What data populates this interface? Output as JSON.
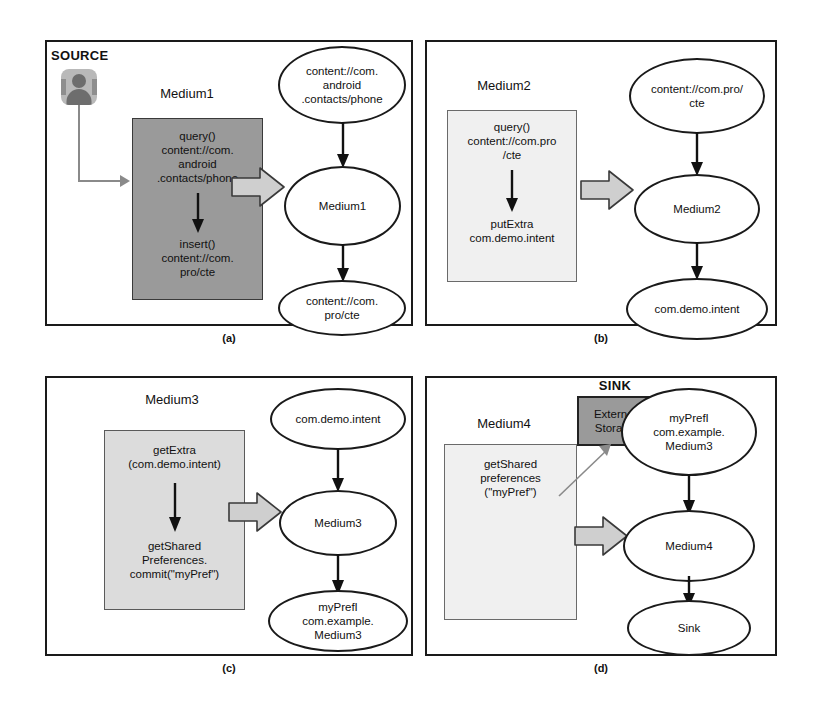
{
  "figure": {
    "panels": [
      {
        "id": "a",
        "caption": "(a)",
        "source_label": "SOURCE",
        "source_icon": "contacts-person-icon",
        "component_label": "Medium1",
        "code_box": {
          "shade": "dark",
          "top_text": "query()\ncontent://com.\nandroid\n.contacts/phone",
          "bottom_text": "insert()\ncontent://com.\npro/cte"
        },
        "graph_nodes": [
          {
            "label": "content://com.\nandroid\n.contacts/phone"
          },
          {
            "label": "Medium1"
          },
          {
            "label": "content://com.\npro/cte"
          }
        ]
      },
      {
        "id": "b",
        "caption": "(b)",
        "component_label": "Medium2",
        "code_box": {
          "shade": "pale",
          "top_text": "query()\ncontent://com.pro\n/cte",
          "bottom_text": "putExtra\ncom.demo.intent"
        },
        "graph_nodes": [
          {
            "label": "content://com.pro/\ncte"
          },
          {
            "label": "Medium2"
          },
          {
            "label": "com.demo.intent"
          }
        ]
      },
      {
        "id": "c",
        "caption": "(c)",
        "component_label": "Medium3",
        "code_box": {
          "shade": "mid",
          "top_text": "getExtra\n(com.demo.intent)",
          "bottom_text": "getShared\nPreferences.\ncommit(\"myPref\")"
        },
        "graph_nodes": [
          {
            "label": "com.demo.intent"
          },
          {
            "label": "Medium3"
          },
          {
            "label": "myPrefI\ncom.example.\nMedium3"
          }
        ]
      },
      {
        "id": "d",
        "caption": "(d)",
        "component_label": "Medium4",
        "sink_label": "SINK",
        "sink_box_text": "External\nStorage",
        "code_box": {
          "shade": "pale",
          "top_text": "getShared\npreferences\n(\"myPref\")",
          "bottom_text": ""
        },
        "graph_nodes": [
          {
            "label": "myPrefI\ncom.example.\nMedium3"
          },
          {
            "label": "Medium4"
          },
          {
            "label": "Sink"
          }
        ]
      }
    ],
    "colors": {
      "outline": "#1a1a1a",
      "box_dark": "#9a9a9a",
      "box_mid": "#dcdcdc",
      "box_light": "#ececec",
      "box_pale": "#f0f0f0",
      "block_arrow_fill": "#cfcfcf"
    }
  }
}
